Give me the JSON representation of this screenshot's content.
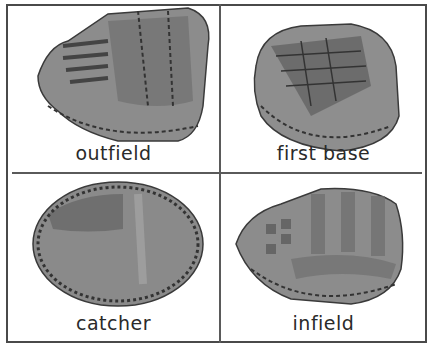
{
  "panels": [
    {
      "label": "outfield",
      "glove": "outfield-glove"
    },
    {
      "label": "first base",
      "glove": "first-base-mitt"
    },
    {
      "label": "catcher",
      "glove": "catcher-mitt"
    },
    {
      "label": "infield",
      "glove": "infield-glove"
    }
  ],
  "colors": {
    "border": "#4a4a4a",
    "leather": "#8a8a8a",
    "leather_dark": "#5e5e5e",
    "lacing": "#3a3a3a",
    "text": "#2a2a2a"
  }
}
